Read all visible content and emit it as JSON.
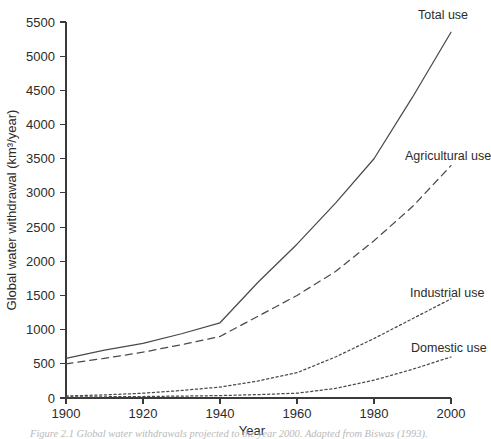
{
  "figure": {
    "caption": "Figure 2.1 Global water withdrawals projected to the year 2000. Adapted from Biswas (1993).",
    "background_color": "#ffffff",
    "line_color": "#4a4a4a",
    "axis_color": "#3a3a3a",
    "text_color": "#2b2b2b"
  },
  "chart_data": {
    "type": "line",
    "title": "",
    "xlabel": "Year",
    "ylabel": "Global water withdrawal (km³/year)",
    "xlim": [
      1900,
      2000
    ],
    "ylim": [
      0,
      5500
    ],
    "xticks": [
      1900,
      1920,
      1940,
      1960,
      1980,
      2000
    ],
    "yticks": [
      0,
      500,
      1000,
      1500,
      2000,
      2500,
      3000,
      3500,
      4000,
      4500,
      5000,
      5500
    ],
    "grid": false,
    "legend_position": "inline-right-end-labels",
    "x": [
      1900,
      1910,
      1920,
      1930,
      1940,
      1950,
      1960,
      1970,
      1980,
      1990,
      2000
    ],
    "series": [
      {
        "name": "Total use",
        "label": "Total use",
        "linestyle": "solid",
        "values": [
          580,
          700,
          800,
          940,
          1100,
          1700,
          2250,
          2850,
          3500,
          4400,
          5350
        ]
      },
      {
        "name": "Agricultural use",
        "label": "Agricultural use",
        "linestyle": "dashed",
        "values": [
          500,
          580,
          670,
          780,
          900,
          1200,
          1500,
          1850,
          2300,
          2800,
          3400
        ]
      },
      {
        "name": "Industrial use",
        "label": "Industrial use",
        "linestyle": "dotted",
        "values": [
          30,
          45,
          70,
          110,
          160,
          250,
          370,
          600,
          870,
          1160,
          1450
        ]
      },
      {
        "name": "Domestic use",
        "label": "Domestic use",
        "linestyle": "dotted",
        "values": [
          15,
          18,
          22,
          28,
          35,
          50,
          70,
          140,
          260,
          420,
          600
        ]
      }
    ]
  }
}
